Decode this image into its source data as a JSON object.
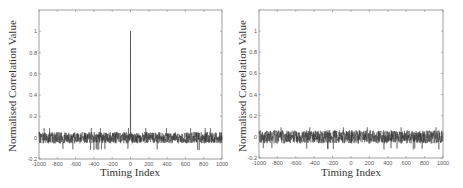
{
  "chart_data": [
    {
      "type": "line",
      "title": "",
      "xlabel": "Timing Index",
      "ylabel": "Normalised Correlation Value",
      "xlim": [
        -1000,
        1000
      ],
      "ylim": [
        -0.2,
        1.2
      ],
      "xticks": [
        -1000,
        -800,
        -600,
        -400,
        -200,
        0,
        200,
        400,
        600,
        800,
        1000
      ],
      "yticks": [
        -0.2,
        0,
        0.2,
        0.4,
        0.6,
        0.8,
        1
      ],
      "grid": false,
      "legend": null,
      "series": [
        {
          "name": "correlation",
          "description": "Noise floor around 0 (approx ±0.06, occasional dips to -0.1) with a single peak of 1.0 at timing index 0",
          "noise_amplitude": 0.06,
          "peak": {
            "x": 0,
            "y": 1.0
          }
        }
      ]
    },
    {
      "type": "line",
      "title": "",
      "xlabel": "Timing Index",
      "ylabel": "Normalised Correlation Value",
      "xlim": [
        -1000,
        1000
      ],
      "ylim": [
        -0.2,
        1.2
      ],
      "xticks": [
        -1000,
        -800,
        -600,
        -400,
        -200,
        0,
        200,
        400,
        600,
        800,
        1000
      ],
      "yticks": [
        -0.2,
        0,
        0.2,
        0.4,
        0.6,
        0.8,
        1
      ],
      "grid": false,
      "legend": null,
      "series": [
        {
          "name": "correlation",
          "description": "Noise floor around 0 (approx ±0.07, occasional peaks to ~0.1, dips to -0.1), no distinct peak",
          "noise_amplitude": 0.07,
          "peak": null
        }
      ]
    }
  ],
  "left": {
    "xlabel": "Timing Index",
    "ylabel": "Normalised Correlation Value"
  },
  "right": {
    "xlabel": "Timing Index",
    "ylabel": "Normalised Correlation Value"
  }
}
